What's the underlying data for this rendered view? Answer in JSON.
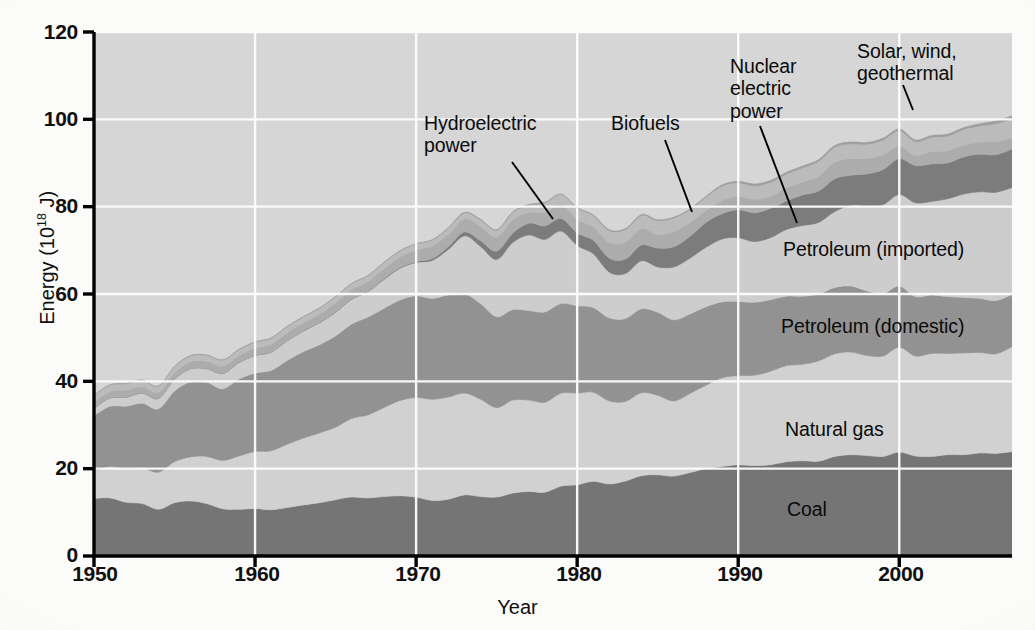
{
  "chart_data": {
    "type": "area",
    "title": "",
    "subtitle": "",
    "xlabel": "Year",
    "ylabel": "Energy (10^18 J)",
    "ylabel_parts": {
      "prefix": "Energy (10",
      "exponent": "18",
      "suffix": " J)"
    },
    "xlim": [
      1950,
      2007
    ],
    "ylim": [
      0,
      120
    ],
    "yticks": [
      0,
      20,
      40,
      60,
      80,
      100,
      120
    ],
    "xticks": [
      1950,
      1960,
      1970,
      1980,
      1990,
      2000
    ],
    "grid": "white gridlines on both axes",
    "legend": "inline labels on areas plus leader-line callouts",
    "stacking": "bottom-to-top: Coal, Natural gas, Petroleum (domestic), Petroleum (imported), Nuclear electric power, Hydroelectric power, Biofuels, Solar, wind, geothermal",
    "x": [
      1950,
      1951,
      1952,
      1953,
      1954,
      1955,
      1956,
      1957,
      1958,
      1959,
      1960,
      1961,
      1962,
      1963,
      1964,
      1965,
      1966,
      1967,
      1968,
      1969,
      1970,
      1971,
      1972,
      1973,
      1974,
      1975,
      1976,
      1977,
      1978,
      1979,
      1980,
      1981,
      1982,
      1983,
      1984,
      1985,
      1986,
      1987,
      1988,
      1989,
      1990,
      1991,
      1992,
      1993,
      1994,
      1995,
      1996,
      1997,
      1998,
      1999,
      2000,
      2001,
      2002,
      2003,
      2004,
      2005,
      2006,
      2007
    ],
    "series": [
      {
        "name": "Coal",
        "color": "#767676",
        "values": [
          13.2,
          13.3,
          12.3,
          12.0,
          10.7,
          12.2,
          12.6,
          12.0,
          10.8,
          10.7,
          10.9,
          10.6,
          11.1,
          11.7,
          12.2,
          12.9,
          13.5,
          13.3,
          13.6,
          13.8,
          13.5,
          12.7,
          13.0,
          14.0,
          13.6,
          13.5,
          14.4,
          14.8,
          14.6,
          16.0,
          16.3,
          17.1,
          16.5,
          17.2,
          18.4,
          18.6,
          18.3,
          19.1,
          20.0,
          20.5,
          20.9,
          20.7,
          20.9,
          21.6,
          21.8,
          21.7,
          22.8,
          23.2,
          23.0,
          22.8,
          23.8,
          22.9,
          22.8,
          23.2,
          23.2,
          23.6,
          23.5,
          23.9
        ]
      },
      {
        "name": "Natural gas",
        "color": "#d3d3d3",
        "values": [
          6.4,
          7.2,
          7.7,
          8.2,
          8.5,
          9.4,
          10.1,
          10.8,
          11.1,
          12.2,
          13.0,
          13.5,
          14.5,
          15.3,
          16.0,
          16.6,
          18.0,
          19.0,
          20.4,
          21.8,
          22.8,
          23.2,
          23.4,
          23.3,
          22.3,
          20.5,
          21.3,
          20.9,
          20.6,
          21.3,
          21.0,
          20.4,
          19.0,
          18.2,
          19.0,
          18.2,
          17.2,
          18.1,
          19.1,
          20.3,
          20.4,
          20.7,
          21.4,
          22.0,
          22.1,
          23.0,
          23.5,
          23.5,
          22.9,
          23.0,
          24.0,
          22.9,
          23.6,
          23.2,
          23.3,
          23.0,
          22.8,
          24.0
        ]
      },
      {
        "name": "Petroleum (domestic)",
        "color": "#949494",
        "values": [
          12.6,
          13.8,
          14.3,
          14.8,
          14.5,
          16.2,
          17.2,
          17.0,
          16.4,
          17.6,
          18.0,
          18.4,
          19.2,
          19.8,
          20.2,
          20.9,
          21.6,
          22.4,
          22.7,
          23.0,
          23.3,
          23.1,
          23.4,
          22.8,
          21.9,
          20.8,
          20.7,
          20.5,
          20.7,
          20.5,
          20.0,
          19.4,
          19.0,
          19.0,
          19.2,
          19.0,
          18.6,
          18.2,
          18.0,
          17.4,
          17.0,
          16.7,
          16.4,
          15.9,
          15.6,
          15.3,
          15.2,
          15.1,
          14.8,
          14.3,
          14.0,
          13.6,
          13.4,
          13.0,
          12.7,
          12.4,
          12.2,
          12.0
        ]
      },
      {
        "name": "Petroleum (imported)",
        "color": "#cfcfcf",
        "values": [
          1.6,
          1.9,
          2.1,
          2.3,
          2.4,
          2.7,
          3.0,
          3.1,
          3.5,
          3.8,
          4.0,
          4.2,
          4.5,
          4.7,
          5.0,
          5.4,
          5.7,
          5.8,
          6.6,
          7.3,
          7.6,
          8.7,
          10.4,
          13.2,
          13.1,
          13.1,
          15.4,
          17.3,
          16.6,
          16.6,
          13.8,
          12.3,
          10.5,
          10.3,
          11.0,
          10.4,
          12.1,
          12.8,
          13.6,
          14.4,
          14.6,
          13.9,
          14.2,
          15.3,
          16.2,
          16.4,
          17.4,
          18.5,
          19.5,
          20.4,
          21.0,
          21.5,
          21.4,
          22.4,
          23.7,
          24.4,
          24.8,
          24.5
        ]
      },
      {
        "name": "Nuclear electric power",
        "color": "#7d7d7d",
        "values": [
          0.0,
          0.0,
          0.0,
          0.0,
          0.0,
          0.0,
          0.0,
          0.0,
          0.0,
          0.0,
          0.0,
          0.0,
          0.0,
          0.1,
          0.1,
          0.1,
          0.1,
          0.1,
          0.2,
          0.2,
          0.2,
          0.4,
          0.6,
          0.9,
          1.3,
          1.9,
          2.1,
          2.7,
          3.1,
          2.9,
          2.9,
          3.1,
          3.2,
          3.3,
          3.6,
          4.3,
          4.6,
          5.0,
          5.7,
          5.8,
          6.4,
          6.6,
          6.7,
          6.5,
          7.0,
          7.2,
          7.5,
          6.9,
          7.3,
          8.0,
          8.2,
          8.5,
          8.6,
          8.2,
          8.5,
          8.6,
          8.6,
          8.8
        ]
      },
      {
        "name": "Hydroelectric power",
        "color": "#aeaeae",
        "values": [
          1.5,
          1.5,
          1.6,
          1.5,
          1.4,
          1.5,
          1.6,
          1.7,
          1.7,
          1.6,
          1.7,
          1.8,
          1.9,
          1.8,
          1.9,
          2.1,
          2.1,
          2.2,
          2.3,
          2.4,
          2.7,
          2.9,
          2.9,
          3.0,
          3.3,
          3.2,
          3.1,
          2.5,
          3.1,
          3.2,
          3.1,
          3.1,
          3.6,
          3.9,
          3.8,
          3.1,
          3.5,
          3.1,
          2.7,
          3.0,
          3.1,
          3.1,
          2.8,
          3.1,
          2.9,
          3.4,
          3.8,
          3.8,
          3.5,
          3.4,
          2.9,
          2.3,
          2.8,
          2.8,
          2.7,
          2.8,
          3.0,
          2.5
        ]
      },
      {
        "name": "Biofuels",
        "color": "#bdbdbd",
        "values": [
          1.5,
          1.5,
          1.5,
          1.5,
          1.4,
          1.4,
          1.4,
          1.4,
          1.4,
          1.4,
          1.4,
          1.4,
          1.4,
          1.4,
          1.4,
          1.4,
          1.4,
          1.4,
          1.4,
          1.4,
          1.4,
          1.4,
          1.4,
          1.4,
          1.5,
          1.6,
          1.7,
          1.7,
          2.2,
          2.3,
          2.6,
          2.6,
          2.7,
          2.9,
          3.0,
          3.2,
          3.1,
          3.0,
          3.1,
          3.3,
          3.1,
          3.1,
          3.2,
          3.1,
          3.3,
          3.4,
          3.4,
          3.4,
          3.3,
          3.4,
          3.5,
          3.2,
          3.3,
          3.4,
          3.6,
          3.7,
          4.1,
          4.4
        ]
      },
      {
        "name": "Solar, wind, geothermal",
        "color": "#a0a0a0",
        "values": [
          0.0,
          0.0,
          0.0,
          0.0,
          0.0,
          0.0,
          0.0,
          0.0,
          0.0,
          0.0,
          0.0,
          0.0,
          0.0,
          0.0,
          0.0,
          0.0,
          0.0,
          0.0,
          0.0,
          0.0,
          0.0,
          0.0,
          0.1,
          0.1,
          0.1,
          0.1,
          0.1,
          0.1,
          0.1,
          0.1,
          0.1,
          0.1,
          0.2,
          0.2,
          0.2,
          0.2,
          0.2,
          0.2,
          0.2,
          0.3,
          0.3,
          0.4,
          0.4,
          0.4,
          0.4,
          0.4,
          0.4,
          0.4,
          0.4,
          0.4,
          0.4,
          0.4,
          0.4,
          0.4,
          0.4,
          0.5,
          0.6,
          0.7
        ]
      }
    ]
  },
  "axes": {
    "y_ticks": [
      "120",
      "100",
      "80",
      "60",
      "40",
      "20",
      "0"
    ],
    "x_ticks": [
      "1950",
      "1960",
      "1970",
      "1980",
      "1990",
      "2000"
    ],
    "x_axis_title": "Year",
    "y_axis_title_prefix": "Energy (10",
    "y_axis_title_exponent": "18",
    "y_axis_title_suffix": " J)"
  },
  "annotations": {
    "hydroelectric": "Hydroelectric\npower",
    "biofuels": "Biofuels",
    "nuclear": "Nuclear\nelectric\npower",
    "solar": "Solar, wind,\ngeothermal",
    "petroleum_imported": "Petroleum (imported)",
    "petroleum_domestic": "Petroleum (domestic)",
    "natural_gas": "Natural gas",
    "coal": "Coal"
  },
  "colors": {
    "coal": "#767676",
    "natural_gas": "#d3d3d3",
    "petroleum_domestic": "#949494",
    "petroleum_imported": "#cfcfcf",
    "nuclear": "#7d7d7d",
    "hydroelectric": "#aeaeae",
    "biofuels": "#bdbdbd",
    "solar_wind_geothermal": "#a0a0a0",
    "gridline": "#ffffff",
    "axis": "#000000",
    "page": "#fdfdfb"
  }
}
